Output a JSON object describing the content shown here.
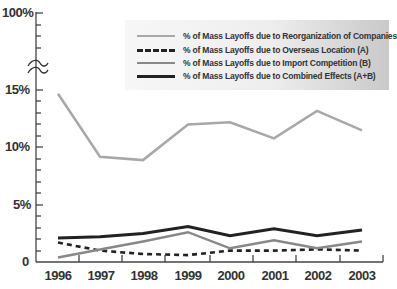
{
  "chart_data": {
    "type": "line",
    "title": "",
    "xlabel": "",
    "ylabel": "",
    "categories": [
      "1996",
      "1997",
      "1998",
      "1999",
      "2000",
      "2001",
      "2002",
      "2003"
    ],
    "y_tick_labels": [
      "0",
      "5%",
      "10%",
      "15%",
      "100%"
    ],
    "ylim": [
      0,
      100
    ],
    "axis_break": "between 15% and 100%",
    "grid": false,
    "legend_position": "upper right",
    "series": [
      {
        "name": "% of Mass Layoffs due to Reorganization of Companies",
        "style": "solid",
        "color": "#a8a8a8",
        "values": [
          14.7,
          9.2,
          8.9,
          12.0,
          12.2,
          10.8,
          13.2,
          11.5
        ]
      },
      {
        "name": "% of Mass Layoffs due to Overseas Location (A)",
        "style": "dashed",
        "color": "#222222",
        "values": [
          1.7,
          1.0,
          0.7,
          0.6,
          1.0,
          1.0,
          1.1,
          1.0
        ]
      },
      {
        "name": "% of Mass Layoffs due to Import Competition (B)",
        "style": "solid",
        "color": "#888888",
        "values": [
          0.4,
          1.1,
          1.8,
          2.6,
          1.2,
          1.9,
          1.2,
          1.8
        ]
      },
      {
        "name": "% of Mass Layoffs due to Combined Effects (A+B)",
        "style": "solid",
        "color": "#222222",
        "values": [
          2.1,
          2.2,
          2.5,
          3.1,
          2.3,
          2.9,
          2.3,
          2.8
        ]
      }
    ]
  },
  "axis": {
    "y_labels": {
      "top": "100%",
      "p15": "15%",
      "p10": "10%",
      "p5": "5%",
      "zero": "0"
    },
    "x_labels": [
      "1996",
      "1997",
      "1998",
      "1999",
      "2000",
      "2001",
      "2002",
      "2003"
    ]
  },
  "legend": {
    "items": [
      {
        "label": "% of Mass Layoffs due to Reorganization of Companies"
      },
      {
        "label": "% of Mass Layoffs due to Overseas Location (A)"
      },
      {
        "label": "% of Mass Layoffs due to Import Competition (B)"
      },
      {
        "label": "% of Mass Layoffs due to Combined Effects (A+B)"
      }
    ]
  }
}
